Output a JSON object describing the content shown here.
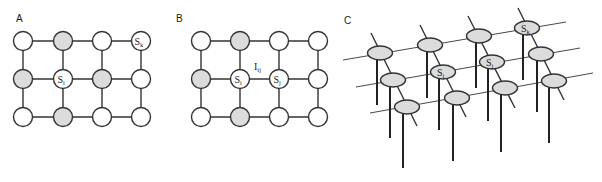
{
  "colors": {
    "node_fill_white": "#ffffff",
    "node_fill_shaded": "#dcdcdc",
    "stroke": "#333333"
  },
  "panels": [
    {
      "label": "A",
      "grid": {
        "cols": 4,
        "rows": 3
      },
      "shaded_nodes": [
        [
          1,
          0
        ],
        [
          0,
          1
        ],
        [
          2,
          1
        ],
        [
          1,
          2
        ]
      ],
      "labeled_nodes": [
        {
          "col": 3,
          "row": 0,
          "text": "S",
          "sub": "k"
        },
        {
          "col": 1,
          "row": 1,
          "text": "S",
          "sub": "i"
        }
      ]
    },
    {
      "label": "B",
      "grid": {
        "cols": 4,
        "rows": 3
      },
      "shaded_nodes": [
        [
          1,
          0
        ],
        [
          0,
          1
        ],
        [
          1,
          2
        ]
      ],
      "labeled_nodes": [
        {
          "col": 1,
          "row": 1,
          "text": "S",
          "sub": "i"
        },
        {
          "col": 2,
          "row": 1,
          "text": "S",
          "sub": "j"
        }
      ],
      "edge_label": {
        "text": "I",
        "sub": "ij"
      }
    },
    {
      "label": "C",
      "grid": {
        "cols": 4,
        "rows": 3
      },
      "style": "perspective lattice of elliptical nodes with vertical stems",
      "labeled_nodes": [
        {
          "col": 3,
          "row": 0,
          "text": "S",
          "sub": "k"
        },
        {
          "col": 1,
          "row": 1,
          "text": "S",
          "sub": "i"
        },
        {
          "col": 2,
          "row": 1,
          "text": "S",
          "sub": "j"
        }
      ]
    }
  ]
}
